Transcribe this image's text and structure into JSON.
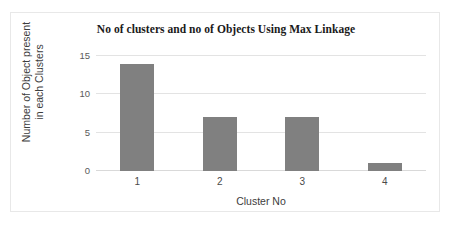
{
  "chart_data": {
    "type": "bar",
    "title": "No of clusters and no of Objects Using Max Linkage",
    "xlabel": "Cluster No",
    "ylabel": "Number of Object present in each Clusters",
    "ylabel_line1": "Number of Object present",
    "ylabel_line2": "in each Clusters",
    "categories": [
      "1",
      "2",
      "3",
      "4"
    ],
    "values": [
      14,
      7,
      7,
      1
    ],
    "yticks": [
      0,
      5,
      10,
      15
    ],
    "ylim": [
      0,
      15
    ],
    "grid": true,
    "legend": "none",
    "bar_color": "#808080",
    "plot_background": "#ffffff",
    "gridline_color": "#e3e3e3",
    "border_color": "#e8e8e8"
  }
}
